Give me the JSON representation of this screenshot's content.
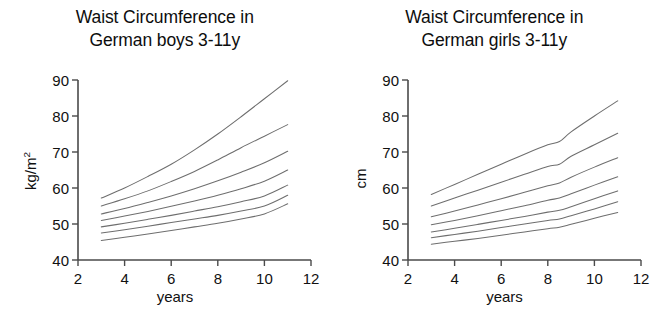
{
  "figure": {
    "background": "#ffffff",
    "curve_color": "#6e6e6e",
    "axis_color": "#4a4a4a"
  },
  "panels": [
    {
      "id": "boys",
      "title": "Waist Circumference in\nGerman boys 3-11y",
      "ylabel": "kg/m²",
      "xlabel": "years"
    },
    {
      "id": "girls",
      "title": "Waist Circumference in\nGerman girls 3-11y",
      "ylabel": "cm",
      "xlabel": "years"
    }
  ],
  "chart_data": [
    {
      "type": "line",
      "title": "Waist Circumference in German boys 3-11y",
      "xlabel": "years",
      "ylabel": "kg/m²",
      "xlim": [
        2,
        12
      ],
      "ylim": [
        40,
        90
      ],
      "xticks": [
        2,
        4,
        6,
        8,
        10,
        12
      ],
      "yticks": [
        40,
        50,
        60,
        70,
        80,
        90
      ],
      "grid": false,
      "legend": "none",
      "x": [
        3,
        4,
        5,
        6,
        7,
        8,
        9,
        10,
        11
      ],
      "series": [
        {
          "name": "P97",
          "values": [
            57.2,
            60.0,
            63.2,
            66.6,
            70.6,
            75.0,
            79.8,
            84.8,
            89.8
          ]
        },
        {
          "name": "P90",
          "values": [
            55.0,
            57.0,
            59.2,
            61.8,
            64.6,
            67.8,
            71.2,
            74.4,
            77.6
          ]
        },
        {
          "name": "P75",
          "values": [
            52.8,
            54.3,
            56.0,
            57.8,
            59.8,
            62.0,
            64.4,
            67.0,
            70.2
          ]
        },
        {
          "name": "P50",
          "values": [
            51.0,
            52.2,
            53.5,
            54.9,
            56.4,
            58.0,
            59.8,
            61.9,
            65.0
          ]
        },
        {
          "name": "P25",
          "values": [
            49.2,
            50.2,
            51.3,
            52.4,
            53.6,
            54.8,
            56.2,
            57.8,
            60.8
          ]
        },
        {
          "name": "P10",
          "values": [
            47.5,
            48.4,
            49.4,
            50.4,
            51.4,
            52.4,
            53.6,
            55.0,
            58.0
          ]
        },
        {
          "name": "P3",
          "values": [
            45.4,
            46.3,
            47.2,
            48.2,
            49.2,
            50.2,
            51.4,
            52.8,
            55.6
          ]
        }
      ]
    },
    {
      "type": "line",
      "title": "Waist Circumference in German girls 3-11y",
      "xlabel": "years",
      "ylabel": "cm",
      "xlim": [
        2,
        12
      ],
      "ylim": [
        40,
        90
      ],
      "xticks": [
        2,
        4,
        6,
        8,
        10,
        12
      ],
      "yticks": [
        40,
        50,
        60,
        70,
        80,
        90
      ],
      "grid": false,
      "legend": "none",
      "x": [
        3,
        4,
        5,
        6,
        7,
        8,
        8.5,
        9,
        10,
        11
      ],
      "series": [
        {
          "name": "P97",
          "values": [
            58.2,
            61.0,
            63.8,
            66.6,
            69.4,
            72.0,
            72.9,
            75.6,
            80.0,
            84.2
          ]
        },
        {
          "name": "P90",
          "values": [
            55.0,
            57.2,
            59.4,
            61.6,
            63.8,
            66.0,
            66.6,
            68.8,
            72.0,
            75.2
          ]
        },
        {
          "name": "P75",
          "values": [
            52.0,
            53.6,
            55.3,
            57.0,
            58.8,
            60.6,
            61.4,
            63.0,
            65.8,
            68.4
          ]
        },
        {
          "name": "P50",
          "values": [
            49.8,
            51.0,
            52.3,
            53.7,
            55.1,
            56.6,
            57.2,
            58.4,
            60.8,
            63.1
          ]
        },
        {
          "name": "P25",
          "values": [
            47.8,
            48.8,
            49.9,
            51.0,
            52.1,
            53.3,
            53.8,
            54.8,
            57.0,
            59.2
          ]
        },
        {
          "name": "P10",
          "values": [
            46.2,
            47.1,
            48.0,
            49.0,
            50.0,
            51.0,
            51.4,
            52.3,
            54.2,
            56.2
          ]
        },
        {
          "name": "P3",
          "values": [
            44.4,
            45.2,
            46.0,
            46.9,
            47.8,
            48.7,
            49.1,
            49.9,
            51.6,
            53.2
          ]
        }
      ]
    }
  ]
}
